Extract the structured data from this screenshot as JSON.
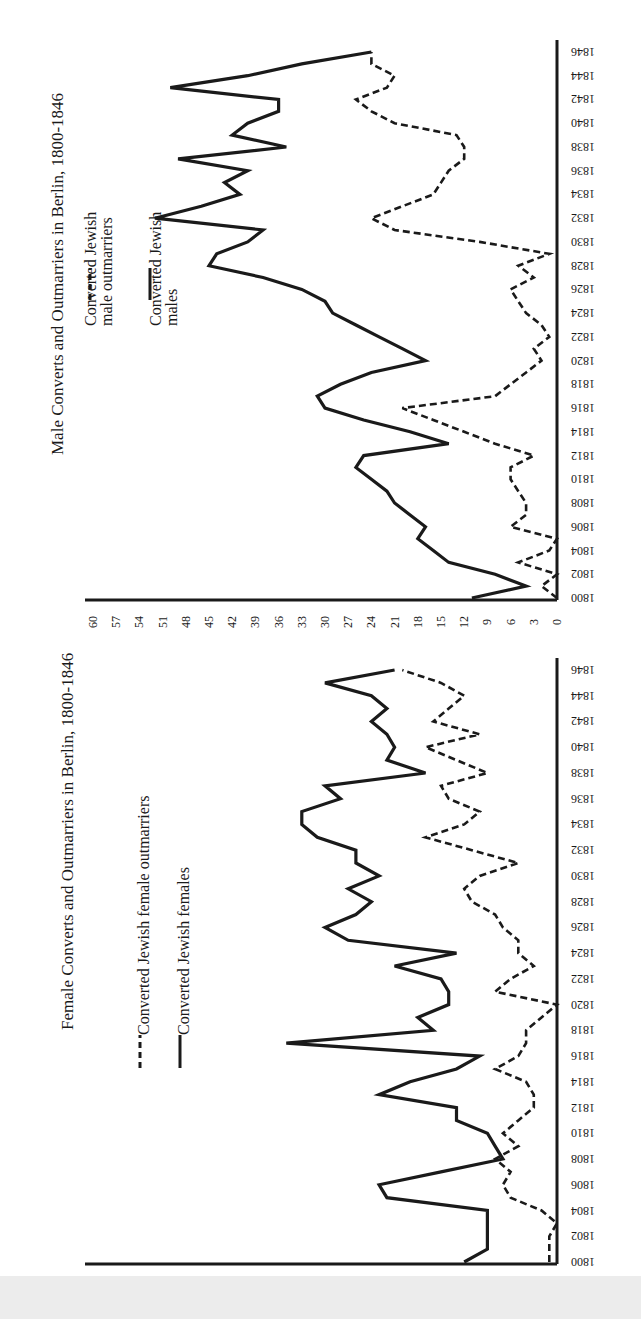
{
  "chart_data": [
    {
      "type": "line",
      "title": "Male Converts and Outmarriers in Berlin, 1800-1846",
      "xlabel": "Year",
      "ylabel": "Count",
      "orientation": "rotated 90deg: years along right edge (1800 bottom to 1846 top), values increase leftward",
      "ylim": [
        0,
        60
      ],
      "yticks": [
        0,
        3,
        6,
        9,
        12,
        15,
        18,
        21,
        24,
        27,
        30,
        33,
        36,
        39,
        42,
        45,
        48,
        51,
        54,
        57,
        60
      ],
      "xticks": [
        1800,
        1802,
        1804,
        1806,
        1808,
        1810,
        1812,
        1814,
        1816,
        1818,
        1820,
        1822,
        1824,
        1826,
        1828,
        1830,
        1832,
        1834,
        1836,
        1838,
        1840,
        1842,
        1844,
        1846
      ],
      "x": [
        1800,
        1801,
        1802,
        1803,
        1804,
        1805,
        1806,
        1807,
        1808,
        1809,
        1810,
        1811,
        1812,
        1813,
        1814,
        1815,
        1816,
        1817,
        1818,
        1819,
        1820,
        1821,
        1822,
        1823,
        1824,
        1825,
        1826,
        1827,
        1828,
        1829,
        1830,
        1831,
        1832,
        1833,
        1834,
        1835,
        1836,
        1837,
        1838,
        1839,
        1840,
        1841,
        1842,
        1843,
        1844,
        1845,
        1846
      ],
      "legend_position": "upper-left (rotated)",
      "series": [
        {
          "name": "Converted Jewish male outmarriers",
          "style": "dashed",
          "values": [
            0,
            2,
            0,
            5,
            1,
            0,
            6,
            4,
            4,
            5,
            6,
            6,
            3,
            8,
            12,
            16,
            20,
            8,
            6,
            4,
            2,
            3,
            1,
            2,
            4,
            5,
            6,
            3,
            5,
            1,
            10,
            21,
            24,
            20,
            16,
            15,
            14,
            12,
            12,
            13,
            21,
            24,
            26,
            22,
            21,
            24,
            24
          ]
        },
        {
          "name": "Converted Jewish males",
          "style": "solid",
          "values": [
            11,
            4,
            8,
            14,
            16,
            18,
            17,
            19,
            21,
            22,
            24,
            26,
            25,
            14,
            19,
            25,
            30,
            31,
            28,
            24,
            17,
            20,
            23,
            26,
            29,
            30,
            33,
            38,
            45,
            44,
            40,
            38,
            52,
            46,
            41,
            43,
            40,
            49,
            35,
            42,
            40,
            36,
            36,
            50,
            40,
            33,
            24
          ]
        }
      ]
    },
    {
      "type": "line",
      "title": "Female Converts and Outmarriers in Berlin, 1800-1846",
      "xlabel": "Year",
      "ylabel": "Count",
      "orientation": "rotated 90deg: years along right edge (1800 bottom to 1846 top), values increase leftward",
      "ylim": [
        0,
        60
      ],
      "yticks": [
        0,
        3,
        6,
        9,
        12,
        15,
        18,
        21,
        24,
        27,
        30,
        33,
        36,
        39,
        42,
        45,
        48,
        51,
        54,
        57,
        60
      ],
      "xticks": [
        1800,
        1802,
        1804,
        1806,
        1808,
        1810,
        1812,
        1814,
        1816,
        1818,
        1820,
        1822,
        1824,
        1826,
        1828,
        1830,
        1832,
        1834,
        1836,
        1838,
        1840,
        1842,
        1844,
        1846
      ],
      "x": [
        1800,
        1801,
        1802,
        1803,
        1804,
        1805,
        1806,
        1807,
        1808,
        1809,
        1810,
        1811,
        1812,
        1813,
        1814,
        1815,
        1816,
        1817,
        1818,
        1819,
        1820,
        1821,
        1822,
        1823,
        1824,
        1825,
        1826,
        1827,
        1828,
        1829,
        1830,
        1831,
        1832,
        1833,
        1834,
        1835,
        1836,
        1837,
        1838,
        1839,
        1840,
        1841,
        1842,
        1843,
        1844,
        1845,
        1846
      ],
      "legend_position": "upper-left (rotated)",
      "series": [
        {
          "name": "Converted Jewish female outmarriers",
          "style": "dashed",
          "values": [
            1,
            1,
            1,
            0,
            2,
            6,
            7,
            6,
            8,
            5,
            7,
            5,
            3,
            3,
            4,
            8,
            5,
            4,
            4,
            2,
            0,
            8,
            6,
            3,
            5,
            5,
            7,
            8,
            11,
            12,
            10,
            5,
            11,
            17,
            12,
            10,
            14,
            15,
            9,
            13,
            17,
            10,
            16,
            14,
            12,
            15,
            20
          ]
        },
        {
          "name": "Converted Jewish females",
          "style": "solid",
          "values": [
            12,
            9,
            9,
            9,
            9,
            22,
            23,
            15,
            7,
            8,
            9,
            13,
            13,
            23,
            19,
            13,
            10,
            35,
            16,
            18,
            14,
            14,
            15,
            21,
            13,
            27,
            30,
            26,
            24,
            27,
            23,
            26,
            26,
            31,
            33,
            33,
            28,
            30,
            17,
            22,
            21,
            22,
            24,
            22,
            24,
            30,
            21
          ]
        }
      ]
    }
  ],
  "panels": {
    "male": {
      "title": "Male Converts and Outmarriers in Berlin, 1800-1846",
      "legend": [
        {
          "icon": "dashed-line-icon",
          "line1": "Converted Jewish",
          "line2": "male outmarriers"
        },
        {
          "icon": "solid-line-icon",
          "line1": "Converted Jewish",
          "line2": "males"
        }
      ]
    },
    "female": {
      "title": "Female Converts and Outmarriers in Berlin, 1800-1846",
      "legend": [
        {
          "icon": "dashed-line-icon",
          "line1": "Converted Jewish female outmarriers"
        },
        {
          "icon": "solid-line-icon",
          "line1": "Converted Jewish females"
        }
      ]
    }
  },
  "colors": {
    "ink": "#1a1a1a",
    "paper": "#ffffff",
    "strip": "#ececec"
  }
}
